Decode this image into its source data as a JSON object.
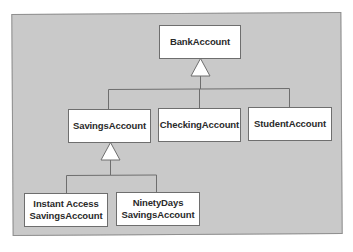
{
  "diagram": {
    "type": "class-inheritance",
    "background_color": "#c9c9c9",
    "box_color": "#ffffff",
    "line_color": "#6e6e6e",
    "classes": {
      "bank_account": {
        "label": "BankAccount"
      },
      "savings_account": {
        "label": "SavingsAccount"
      },
      "checking_account": {
        "label": "CheckingAccount"
      },
      "student_account": {
        "label": "StudentAccount"
      },
      "instant_access": {
        "line1": "Instant Access",
        "line2": "SavingsAccount"
      },
      "ninety_days": {
        "line1": "NinetyDays",
        "line2": "SavingsAccount"
      }
    },
    "relationships": [
      {
        "parent": "BankAccount",
        "children": [
          "SavingsAccount",
          "CheckingAccount",
          "StudentAccount"
        ],
        "kind": "inheritance"
      },
      {
        "parent": "SavingsAccount",
        "children": [
          "Instant Access SavingsAccount",
          "NinetyDays SavingsAccount"
        ],
        "kind": "inheritance"
      }
    ]
  }
}
